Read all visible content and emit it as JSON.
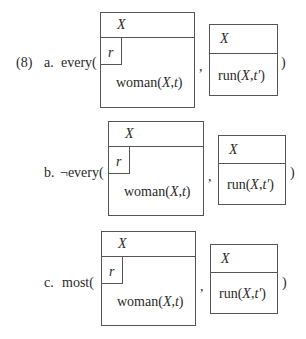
{
  "example_number": "(8)",
  "items": [
    {
      "label": "a.",
      "quantifier": "every(",
      "restrictor": {
        "referent": "X",
        "condition_box_label": "r",
        "condition": "woman(X,t)"
      },
      "separator": ",",
      "scope": {
        "referent": "X",
        "condition": "run(X,t′)"
      },
      "close": ")"
    },
    {
      "label": "b.",
      "quantifier": "¬every(",
      "restrictor": {
        "referent": "X",
        "condition_box_label": "r",
        "condition": "woman(X,t)"
      },
      "separator": ",",
      "scope": {
        "referent": "X",
        "condition": "run(X,t′)"
      },
      "close": ")"
    },
    {
      "label": "c.",
      "quantifier": "most(",
      "restrictor": {
        "referent": "X",
        "condition_box_label": "r",
        "condition": "woman(X,t)"
      },
      "separator": ",",
      "scope": {
        "referent": "X",
        "condition": "run(X,t′)"
      },
      "close": ")"
    }
  ]
}
